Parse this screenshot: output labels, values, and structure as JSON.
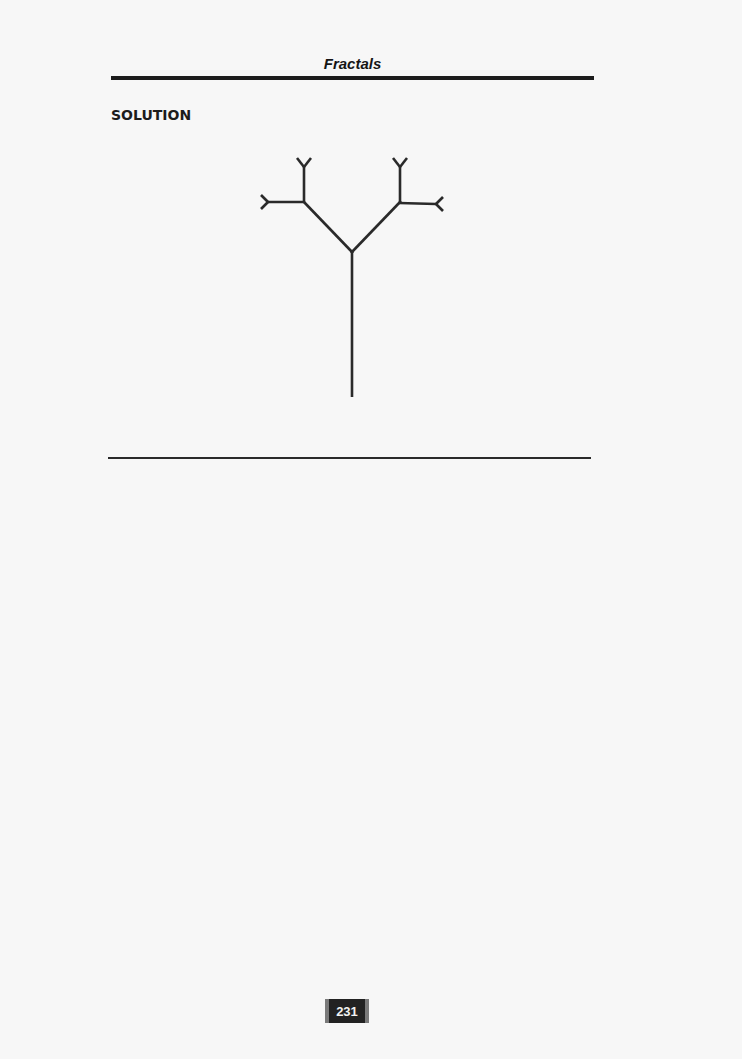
{
  "header": {
    "running_title": "Fractals"
  },
  "section": {
    "label": "SOLUTION"
  },
  "figure": {
    "stroke_color": "#2a2a2a",
    "trunk": {
      "x1": 352,
      "y1": 397,
      "x2": 352,
      "y2": 252
    },
    "branches": [
      {
        "x1": 352,
        "y1": 252,
        "x2": 304,
        "y2": 202
      },
      {
        "x1": 352,
        "y1": 252,
        "x2": 400,
        "y2": 202
      },
      {
        "x1": 304,
        "y1": 202,
        "x2": 304,
        "y2": 167
      },
      {
        "x1": 304,
        "y1": 202,
        "x2": 268,
        "y2": 202
      },
      {
        "x1": 400,
        "y1": 202,
        "x2": 400,
        "y2": 167
      },
      {
        "x1": 400,
        "y1": 202,
        "x2": 436,
        "y2": 204
      }
    ]
  },
  "footer": {
    "page_number": "231"
  }
}
